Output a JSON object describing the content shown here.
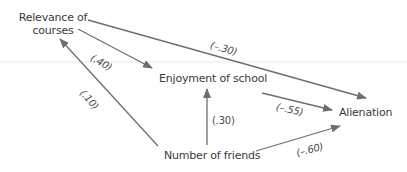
{
  "diagram": {
    "type": "path-diagram",
    "colors": {
      "line": "#6e6e6e",
      "text": "#3a3a3a",
      "background": "#ffffff"
    },
    "nodes": {
      "relevance": {
        "line1": "Relevance of",
        "line2": "courses"
      },
      "enjoyment": {
        "label": "Enjoyment of school"
      },
      "alienation": {
        "label": "Alienation"
      },
      "friends": {
        "label": "Number of friends"
      }
    },
    "edges": [
      {
        "from": "Relevance of courses",
        "to": "Alienation",
        "coefficient": "(–.30)"
      },
      {
        "from": "Relevance of courses",
        "to": "Enjoyment of school",
        "coefficient": "(.40)"
      },
      {
        "from": "Number of friends",
        "to": "Relevance of courses",
        "coefficient": "(.10)"
      },
      {
        "from": "Number of friends",
        "to": "Enjoyment of school",
        "coefficient": "(.30)"
      },
      {
        "from": "Enjoyment of school",
        "to": "Alienation",
        "coefficient": "(–.55)"
      },
      {
        "from": "Number of friends",
        "to": "Alienation",
        "coefficient": "(–.60)"
      }
    ]
  }
}
